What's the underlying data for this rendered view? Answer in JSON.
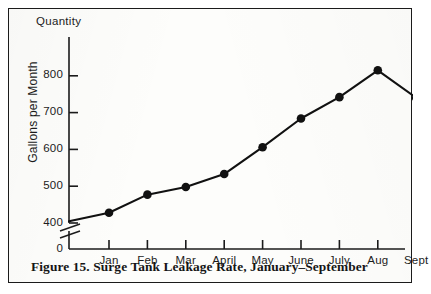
{
  "figure": {
    "caption": "Figure 15. Surge Tank Leakage Rate, January–September",
    "quantity_label": "Quantity",
    "y_axis_title": "Gallons per Month"
  },
  "chart_data": {
    "type": "line",
    "title": "Surge Tank Leakage Rate, January–September",
    "xlabel": "",
    "ylabel": "Gallons per Month",
    "categories": [
      "Jan",
      "Feb",
      "Mar",
      "April",
      "May",
      "June",
      "July",
      "Aug",
      "Sept"
    ],
    "values": [
      428,
      477,
      498,
      533,
      606,
      684,
      742,
      815,
      740
    ],
    "origin_value": 405,
    "y_tick_labels": [
      "800",
      "700",
      "600",
      "500",
      "400"
    ],
    "y_tick_values": [
      800,
      700,
      600,
      500,
      400
    ],
    "zero_label": "0",
    "ylim": [
      400,
      850
    ],
    "axis_break": true,
    "grid": false,
    "legend": "none",
    "marker": "filled-circle",
    "line_color": "#111111",
    "marker_color": "#111111",
    "background_color": "#fdfdfb"
  }
}
